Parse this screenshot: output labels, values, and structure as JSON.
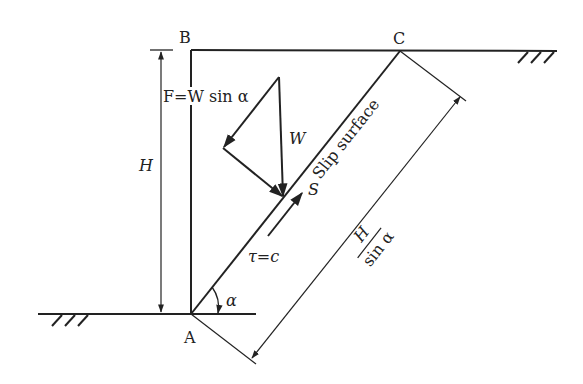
{
  "figure": {
    "colors": {
      "line": "#222222",
      "background": "#ffffff"
    }
  },
  "points": {
    "A": {
      "label": "A"
    },
    "B": {
      "label": "B"
    },
    "C": {
      "label": "C"
    }
  },
  "labels": {
    "height": "H",
    "driving_force": "F=W sin α",
    "weight": "W",
    "slip_surface": "Slip surface",
    "resisting_force": "S",
    "shear_strength": "τ=c",
    "angle": "α",
    "slip_length_numerator": "H",
    "slip_length_denominator": "sin α"
  },
  "icons": {
    "ground_hatch_left": "ground-hatch-icon",
    "ground_hatch_right": "ground-hatch-icon"
  }
}
